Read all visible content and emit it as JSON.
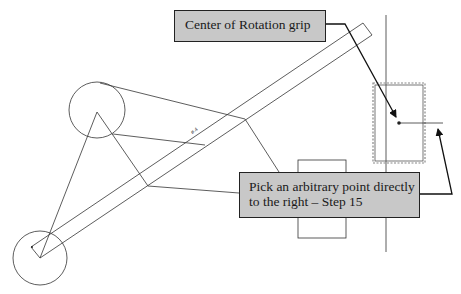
{
  "callouts": {
    "top": {
      "text": "Center of Rotation grip"
    },
    "bottom": {
      "text": "Pick an arbitrary point directly to the right – Step 15"
    }
  },
  "dimension_label": "ø.4",
  "colors": {
    "callout_fill": "#c8c8c8",
    "line": "#333333",
    "background": "#ffffff"
  }
}
